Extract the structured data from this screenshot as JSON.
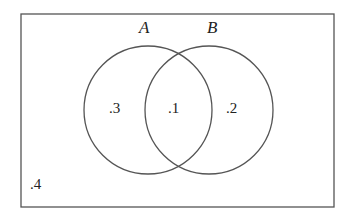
{
  "diagram": {
    "type": "venn",
    "universe": {
      "region_label": ".4"
    },
    "sets": [
      {
        "name": "A",
        "only_label": ".3"
      },
      {
        "name": "B",
        "only_label": ".2"
      }
    ],
    "intersection_label": ".1",
    "colors": {
      "stroke": "#555555",
      "text": "#222222",
      "background": "#ffffff"
    }
  }
}
